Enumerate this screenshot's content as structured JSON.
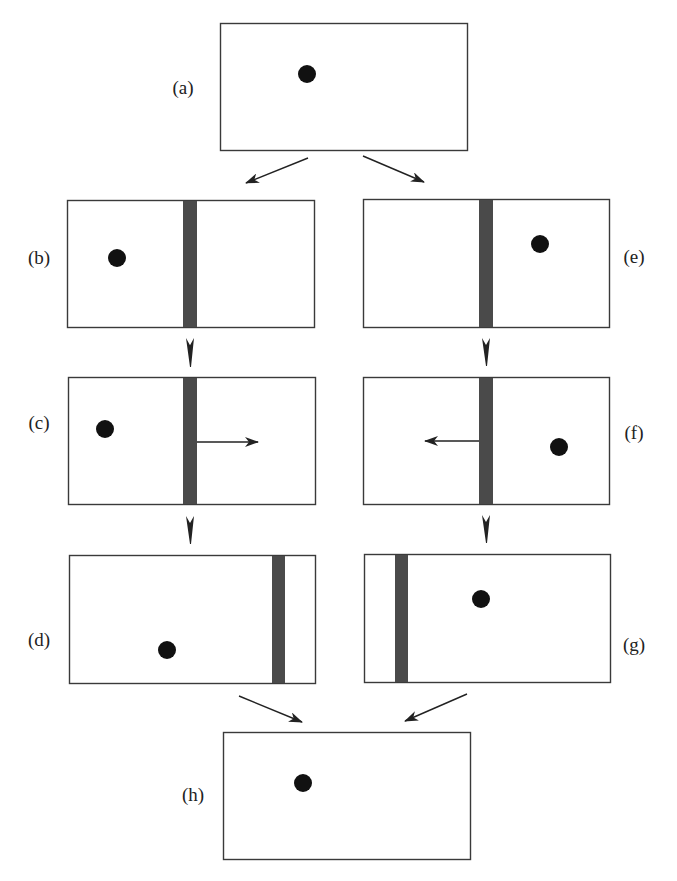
{
  "colors": {
    "frame": "#3a3a3a",
    "bar": "#4a4a4a",
    "dot": "#111111",
    "arrow": "#222222"
  },
  "panels": [
    {
      "id": "a",
      "label": "(a)",
      "box": [
        220,
        23,
        247,
        127
      ],
      "dot": [
        307,
        74
      ],
      "bar": null,
      "arrow": null,
      "label_pos": [
        183,
        94
      ],
      "label_anchor": "middle"
    },
    {
      "id": "b",
      "label": "(b)",
      "box": [
        67,
        200,
        247,
        127
      ],
      "dot": [
        117,
        258
      ],
      "bar": [
        183,
        14
      ],
      "arrow": null,
      "label_pos": [
        39,
        264
      ],
      "label_anchor": "middle"
    },
    {
      "id": "c",
      "label": "(c)",
      "box": [
        68,
        377,
        247,
        127
      ],
      "dot": [
        105,
        429
      ],
      "bar": [
        183,
        14
      ],
      "arrow": {
        "from": [
          197,
          442
        ],
        "to": [
          258,
          442
        ]
      },
      "label_pos": [
        39,
        429
      ],
      "label_anchor": "middle"
    },
    {
      "id": "d",
      "label": "(d)",
      "box": [
        69,
        555,
        246,
        128
      ],
      "dot": [
        167,
        650
      ],
      "bar": [
        272,
        13
      ],
      "arrow": null,
      "label_pos": [
        39,
        646
      ],
      "label_anchor": "middle"
    },
    {
      "id": "e",
      "label": "(e)",
      "box": [
        363,
        199,
        246,
        128
      ],
      "dot": [
        540,
        244
      ],
      "bar": [
        479,
        14
      ],
      "arrow": null,
      "label_pos": [
        634,
        263
      ],
      "label_anchor": "middle"
    },
    {
      "id": "f",
      "label": "(f)",
      "box": [
        363,
        377,
        246,
        127
      ],
      "dot": [
        559,
        447
      ],
      "bar": [
        479,
        14
      ],
      "arrow": {
        "from": [
          479,
          441
        ],
        "to": [
          425,
          441
        ]
      },
      "label_pos": [
        634,
        439
      ],
      "label_anchor": "middle"
    },
    {
      "id": "g",
      "label": "(g)",
      "box": [
        364,
        554,
        246,
        128
      ],
      "dot": [
        481,
        599
      ],
      "bar": [
        395,
        13
      ],
      "arrow": null,
      "label_pos": [
        634,
        651
      ],
      "label_anchor": "middle"
    },
    {
      "id": "h",
      "label": "(h)",
      "box": [
        223,
        732,
        247,
        127
      ],
      "dot": [
        303,
        783
      ],
      "bar": null,
      "arrow": null,
      "label_pos": [
        193,
        801
      ],
      "label_anchor": "middle"
    }
  ],
  "flow_arrows": [
    {
      "from": [
        308,
        158
      ],
      "to": [
        246,
        183
      ]
    },
    {
      "from": [
        363,
        156
      ],
      "to": [
        424,
        182
      ]
    },
    {
      "from": [
        239,
        696
      ],
      "to": [
        302,
        722
      ]
    },
    {
      "from": [
        467,
        694
      ],
      "to": [
        405,
        721
      ]
    }
  ],
  "down_arrowheads": [
    {
      "x": 190,
      "y_top": 338,
      "y_tip": 367
    },
    {
      "x": 486,
      "y_top": 338,
      "y_tip": 366
    },
    {
      "x": 190,
      "y_top": 516,
      "y_tip": 544
    },
    {
      "x": 486,
      "y_top": 515,
      "y_tip": 543
    }
  ],
  "dot_radius": 9
}
